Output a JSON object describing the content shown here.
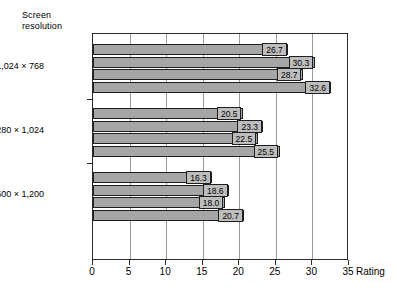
{
  "chart_data": {
    "type": "bar",
    "orientation": "horizontal",
    "title": "",
    "ylabel": "Screen resolution",
    "xlabel": "Rating",
    "xlim": [
      0,
      35
    ],
    "xticks": [
      0,
      5,
      10,
      15,
      20,
      25,
      30,
      35
    ],
    "grid": true,
    "legend": false,
    "categories": [
      "1,024 × 768",
      "1,280 × 1,024",
      "1,600 × 1,200"
    ],
    "series": [
      {
        "name": "bar-1",
        "values": [
          26.7,
          20.5,
          16.3
        ]
      },
      {
        "name": "bar-2",
        "values": [
          30.3,
          23.3,
          18.6
        ]
      },
      {
        "name": "bar-3",
        "values": [
          28.7,
          22.5,
          18.0
        ]
      },
      {
        "name": "bar-4",
        "values": [
          32.6,
          25.5,
          20.7
        ]
      }
    ],
    "groups": [
      {
        "category": "1,024 × 768",
        "values": [
          26.7,
          30.3,
          28.7,
          32.6
        ],
        "labels": [
          "26.7",
          "30.3",
          "28.7",
          "32.6"
        ]
      },
      {
        "category": "1,280 × 1,024",
        "values": [
          20.5,
          23.3,
          22.5,
          25.5
        ],
        "labels": [
          "20.5",
          "23.3",
          "22.5",
          "25.5"
        ]
      },
      {
        "category": "1,600 × 1,200",
        "values": [
          16.3,
          18.6,
          18.0,
          20.7
        ],
        "labels": [
          "16.3",
          "18.6",
          "18.0",
          "20.7"
        ]
      }
    ],
    "colors": {
      "bar_fill": "#a6a6a6",
      "bar_stroke": "#1f1f1f",
      "label_fill": "#bdbdbd",
      "gridline": "#9a9a9a",
      "axis": "#2b2b2b",
      "background": "#ffffff"
    }
  },
  "axis": {
    "y_title": "Screen\nresolution",
    "x_title": "Rating",
    "x_tick_labels": [
      "0",
      "5",
      "10",
      "15",
      "20",
      "25",
      "30",
      "35"
    ]
  }
}
